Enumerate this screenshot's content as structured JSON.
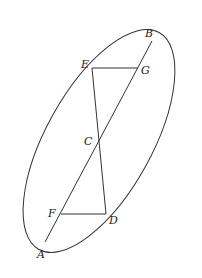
{
  "diagram": {
    "type": "geometry",
    "stroke_color": "#333333",
    "points": {
      "A": {
        "label": "A",
        "x": 45,
        "y": 242
      },
      "B": {
        "label": "B",
        "x": 152,
        "y": 41
      },
      "C": {
        "label": "C",
        "x": 98,
        "y": 142
      },
      "D": {
        "label": "D",
        "x": 106,
        "y": 214
      },
      "E": {
        "label": "E",
        "x": 92,
        "y": 68
      },
      "F": {
        "label": "F",
        "x": 61,
        "y": 214
      },
      "G": {
        "label": "G",
        "x": 138,
        "y": 68
      }
    },
    "segments": [
      "AB",
      "ED",
      "EG",
      "FD"
    ],
    "curves": [
      "ellipse through A, B, E, D"
    ]
  }
}
